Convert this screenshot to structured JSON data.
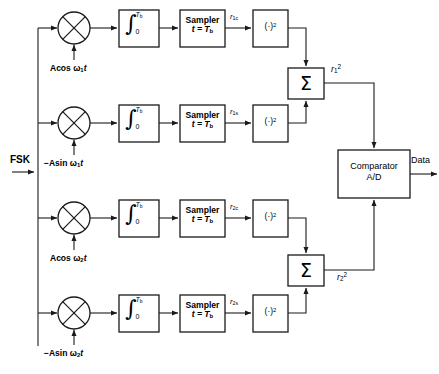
{
  "diagram": {
    "input": {
      "label": "FSK",
      "name": "fsk-input"
    },
    "output": {
      "label": "Data",
      "name": "data-output"
    },
    "colors": {
      "line": "#1a1a1a",
      "background": "#ffffff"
    },
    "branches": [
      {
        "id": "branch-1c",
        "mixer": "multiplier",
        "local_oscillator": {
          "prefix": "A",
          "fn": "cos",
          "omega": "ω",
          "sub": "1",
          "time": "t",
          "full": "Acos ω1t"
        },
        "integrator": {
          "symbol": "∫",
          "lower": "0",
          "upper": "T",
          "upper_sub": "b",
          "full": "∫0^Tb"
        },
        "sampler": {
          "line1": "Sampler",
          "line2_lhs": "t =",
          "line2_rhs": "T",
          "line2_sub": "b",
          "full": "Sampler t = Tb"
        },
        "signal_label": {
          "base": "r",
          "sub": "1c"
        },
        "squarer": {
          "label": "(·)",
          "exp": "2"
        }
      },
      {
        "id": "branch-1s",
        "mixer": "multiplier",
        "local_oscillator": {
          "prefix": "−A",
          "fn": "sin",
          "omega": "ω",
          "sub": "1",
          "time": "t",
          "full": "−Asin ω1t"
        },
        "integrator": {
          "symbol": "∫",
          "lower": "0",
          "upper": "T",
          "upper_sub": "b",
          "full": "∫0^Tb"
        },
        "sampler": {
          "line1": "Sampler",
          "line2_lhs": "t =",
          "line2_rhs": "T",
          "line2_sub": "b",
          "full": "Sampler t = Tb"
        },
        "signal_label": {
          "base": "r",
          "sub": "1s"
        },
        "squarer": {
          "label": "(·)",
          "exp": "2"
        }
      },
      {
        "id": "branch-2c",
        "mixer": "multiplier",
        "local_oscillator": {
          "prefix": "A",
          "fn": "cos",
          "omega": "ω",
          "sub": "2",
          "time": "t",
          "full": "Acos ω2t"
        },
        "integrator": {
          "symbol": "∫",
          "lower": "0",
          "upper": "T",
          "upper_sub": "b",
          "full": "∫0^Tb"
        },
        "sampler": {
          "line1": "Sampler",
          "line2_lhs": "t =",
          "line2_rhs": "T",
          "line2_sub": "b",
          "full": "Sampler t = Tb"
        },
        "signal_label": {
          "base": "r",
          "sub": "2c"
        },
        "squarer": {
          "label": "(·)",
          "exp": "2"
        }
      },
      {
        "id": "branch-2s",
        "mixer": "multiplier",
        "local_oscillator": {
          "prefix": "−A",
          "fn": "sin",
          "omega": "ω",
          "sub": "2",
          "time": "t",
          "full": "−Asin ω2t"
        },
        "integrator": {
          "symbol": "∫",
          "lower": "0",
          "upper": "T",
          "upper_sub": "b",
          "full": "∫0^Tb"
        },
        "sampler": {
          "line1": "Sampler",
          "line2_lhs": "t =",
          "line2_rhs": "T",
          "line2_sub": "b",
          "full": "Sampler t = Tb"
        },
        "signal_label": {
          "base": "r",
          "sub": "2s"
        },
        "squarer": {
          "label": "(·)",
          "exp": "2"
        }
      }
    ],
    "summers": [
      {
        "id": "summer-1",
        "symbol": "Σ",
        "output": {
          "base": "r",
          "sub": "1",
          "exp": "2"
        }
      },
      {
        "id": "summer-2",
        "symbol": "Σ",
        "output": {
          "base": "r",
          "sub": "2",
          "exp": "2"
        }
      }
    ],
    "comparator": {
      "line1": "Comparator",
      "line2": "A/D",
      "full": "Comparator A/D"
    }
  }
}
